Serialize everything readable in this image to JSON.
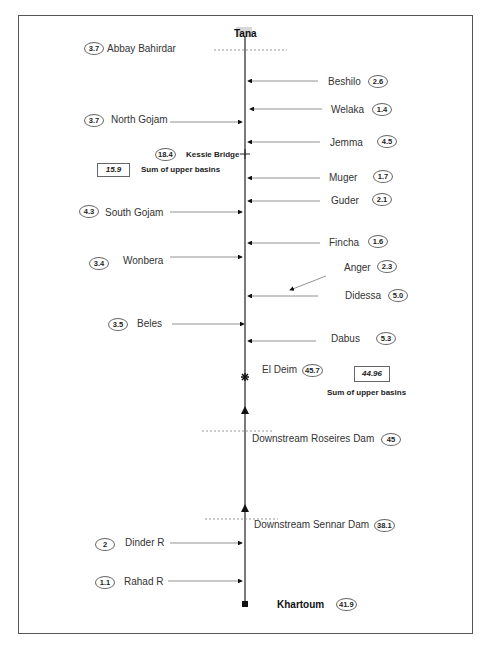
{
  "diagram": {
    "type": "river-network-schematic",
    "main_river": {
      "source": "Tana",
      "outlet": "Khartoum"
    },
    "source": {
      "label": "Tana"
    },
    "stations": [
      {
        "id": "abbay-bahirdar",
        "label": "Abbay Bahirdar",
        "value": "3.7",
        "side": "left",
        "kind": "gauge-line"
      },
      {
        "id": "kessie-bridge",
        "label": "Kessie Bridge",
        "value": "18.4",
        "side": "left",
        "kind": "cross-marker"
      },
      {
        "id": "el-deim",
        "label": "El Deim",
        "value": "45.7",
        "side": "right",
        "kind": "star-marker"
      },
      {
        "id": "downstream-roseires-dam",
        "label": "Downstream Roseires Dam",
        "value": "45",
        "side": "right",
        "kind": "gauge-line"
      },
      {
        "id": "downstream-sennar-dam",
        "label": "Downstream Sennar Dam",
        "value": "38.1",
        "side": "right",
        "kind": "gauge-line"
      },
      {
        "id": "khartoum",
        "label": "Khartoum",
        "value": "41.9",
        "side": "right",
        "kind": "square-marker"
      }
    ],
    "tributaries_right": [
      {
        "label": "Beshilo",
        "value": "2.6"
      },
      {
        "label": "Welaka",
        "value": "1.4"
      },
      {
        "label": "Jemma",
        "value": "4.5"
      },
      {
        "label": "Muger",
        "value": "1.7"
      },
      {
        "label": "Guder",
        "value": "2.1"
      },
      {
        "label": "Fincha",
        "value": "1.6"
      },
      {
        "label": "Anger",
        "value": "2.3"
      },
      {
        "label": "Didessa",
        "value": "5.0"
      },
      {
        "label": "Dabus",
        "value": "5.3"
      }
    ],
    "tributaries_left": [
      {
        "label": "North Gojam",
        "value": "3.7"
      },
      {
        "label": "South Gojam",
        "value": "4.3"
      },
      {
        "label": "Wonbera",
        "value": "3.4"
      },
      {
        "label": "Beles",
        "value": "3.5"
      },
      {
        "label": "Dinder R",
        "value": "2"
      },
      {
        "label": "Rahad R",
        "value": "1.1"
      }
    ],
    "sums": [
      {
        "value": "15.9",
        "label": "Sum of upper basins"
      },
      {
        "value": "44.96",
        "label": "Sum of upper basins"
      }
    ]
  }
}
